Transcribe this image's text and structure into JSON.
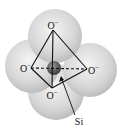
{
  "diagram": {
    "labels": {
      "oxygen_top": "O",
      "oxygen_left": "O",
      "oxygen_right": "O",
      "oxygen_bottom": "O",
      "charge": "−",
      "silicon": "Si"
    },
    "colors": {
      "oxygen_sphere": "#d9d9d9",
      "oxygen_highlight": "#f4f4f4",
      "silicon_sphere": "#555555",
      "bonds": "#111111"
    }
  }
}
